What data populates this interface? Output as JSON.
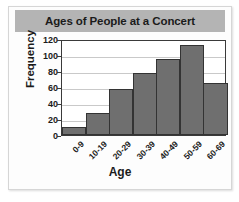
{
  "chart_data": {
    "type": "bar",
    "title": "Ages of People at a Concert",
    "xlabel": "Age",
    "ylabel": "Frequency",
    "categories": [
      "0-9",
      "10-19",
      "20-29",
      "30-39",
      "40-49",
      "50-59",
      "60-69"
    ],
    "values": [
      10,
      28,
      57,
      77,
      95,
      113,
      65
    ],
    "ylim": [
      0,
      120
    ],
    "yticks": [
      0,
      20,
      40,
      60,
      80,
      100,
      120
    ],
    "ytick_labels": [
      "0",
      "20",
      "40",
      "60",
      "80",
      "100",
      "120"
    ],
    "grid": true,
    "legend": false,
    "colors": {
      "bar_fill": "#6f6f6f",
      "bar_edge": "#333333",
      "banner": "#b4b4b4",
      "text": "#1b1b1b",
      "gridline": "#c9c9c9",
      "axis": "#3a3a3a",
      "plot_background": "#ffffff",
      "figure_background": "#fdfdfd"
    }
  }
}
